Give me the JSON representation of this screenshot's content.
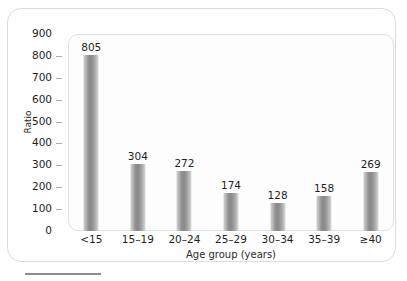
{
  "chart_data": {
    "type": "bar",
    "title": "",
    "subtitle": "",
    "xlabel": "Age group (years)",
    "ylabel": "Ratio",
    "categories": [
      "<15",
      "15–19",
      "20–24",
      "25–29",
      "30–34",
      "35–39",
      "≥40"
    ],
    "values": [
      805,
      304,
      272,
      174,
      128,
      158,
      269
    ],
    "data_labels": [
      "805",
      "304",
      "272",
      "174",
      "128",
      "158",
      "269"
    ],
    "series": [
      {
        "name": "Ratio",
        "values": [
          805,
          304,
          272,
          174,
          128,
          158,
          269
        ]
      }
    ],
    "ylim": [
      0,
      900
    ],
    "ytick_step": 100,
    "yticks": [
      0,
      100,
      200,
      300,
      400,
      500,
      600,
      700,
      800,
      900
    ],
    "ytick_labels": [
      "0",
      "100",
      "200",
      "300",
      "400",
      "500",
      "600",
      "700",
      "800",
      "900"
    ],
    "grid": false,
    "legend": null,
    "legend_position": "none",
    "bar_color": "#8f8f8f",
    "bar_edge_color": "#d8d8d8",
    "panel_background": "#fdfdfd",
    "frame_color": "#dcdcdc",
    "text_color": "#1f1f1f",
    "annotations": []
  },
  "figure": {
    "caption_rule_color": "#8d8d8d"
  }
}
